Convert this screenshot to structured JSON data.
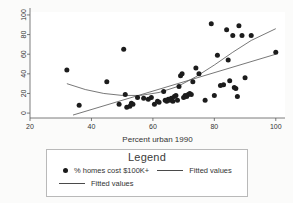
{
  "chart_data": {
    "type": "scatter",
    "title": "",
    "xlabel": "Percent urban 1990",
    "ylabel": "",
    "xlim": [
      20,
      103
    ],
    "ylim": [
      -5,
      103
    ],
    "xticks": [
      20,
      40,
      60,
      80,
      100
    ],
    "yticks": [
      0,
      20,
      40,
      60,
      80,
      100
    ],
    "grid": false,
    "legend_position": "below-plot",
    "series": [
      {
        "name": "% homes cost $100K+",
        "type": "scatter",
        "marker": "filled-circle",
        "color": "#1c1c1c",
        "points": [
          [
            32,
            44
          ],
          [
            36,
            8
          ],
          [
            45,
            32
          ],
          [
            49,
            9
          ],
          [
            50.5,
            65
          ],
          [
            51,
            19
          ],
          [
            51.5,
            6
          ],
          [
            52.5,
            7
          ],
          [
            53,
            10
          ],
          [
            53.5,
            9
          ],
          [
            55,
            16
          ],
          [
            57,
            15
          ],
          [
            58.5,
            14
          ],
          [
            59.5,
            16
          ],
          [
            60.5,
            9
          ],
          [
            61.5,
            12
          ],
          [
            62,
            11
          ],
          [
            63.5,
            22
          ],
          [
            64,
            13
          ],
          [
            64.5,
            12
          ],
          [
            65,
            14
          ],
          [
            65.5,
            13
          ],
          [
            66,
            15
          ],
          [
            66.5,
            12
          ],
          [
            67,
            17
          ],
          [
            67.5,
            18
          ],
          [
            68,
            13
          ],
          [
            68.5,
            27
          ],
          [
            69,
            38
          ],
          [
            69.5,
            40
          ],
          [
            70,
            16
          ],
          [
            70.5,
            18
          ],
          [
            71,
            17
          ],
          [
            71.5,
            19
          ],
          [
            72,
            20
          ],
          [
            72.5,
            19
          ],
          [
            73,
            32
          ],
          [
            74,
            46
          ],
          [
            75,
            40
          ],
          [
            77,
            13
          ],
          [
            79,
            91
          ],
          [
            80,
            18
          ],
          [
            81,
            59
          ],
          [
            82,
            28
          ],
          [
            83,
            29
          ],
          [
            84,
            85
          ],
          [
            84.5,
            54
          ],
          [
            85,
            33
          ],
          [
            86,
            79
          ],
          [
            86.5,
            26
          ],
          [
            87,
            25
          ],
          [
            87.5,
            17
          ],
          [
            88,
            89
          ],
          [
            89,
            79
          ],
          [
            90,
            36
          ],
          [
            92,
            79
          ],
          [
            100,
            62
          ]
        ]
      },
      {
        "name": "Fitted values",
        "type": "line",
        "shape": "quadratic",
        "color": "#555555",
        "points": [
          [
            32,
            30
          ],
          [
            38,
            24
          ],
          [
            44,
            20
          ],
          [
            50,
            18
          ],
          [
            56,
            18
          ],
          [
            62,
            21
          ],
          [
            68,
            27
          ],
          [
            74,
            37
          ],
          [
            80,
            49
          ],
          [
            86,
            62
          ],
          [
            92,
            74
          ],
          [
            100,
            86
          ]
        ]
      },
      {
        "name": "Fitted values",
        "type": "line",
        "shape": "linear",
        "color": "#555555",
        "points": [
          [
            34,
            -2
          ],
          [
            100,
            60
          ]
        ]
      }
    ]
  },
  "legend": {
    "title": "Legend",
    "entries": [
      {
        "marker": "filled-circle",
        "label": "% homes cost $100K+"
      },
      {
        "marker": "line",
        "label": "Fitted values"
      },
      {
        "marker": "line",
        "label": "Fitted values"
      }
    ]
  },
  "axes": {
    "x_label": "Percent urban 1990",
    "x_tick_labels": [
      "20",
      "40",
      "60",
      "80",
      "100"
    ],
    "y_tick_labels": [
      "0",
      "20",
      "40",
      "60",
      "80",
      "100"
    ]
  },
  "colors": {
    "marker": "#1c1c1c",
    "fit_line": "#555555",
    "axis": "#5a5a5a",
    "background": "#fbfbfa",
    "panel": "#ffffff",
    "legend_border": "#b9b9b9"
  }
}
